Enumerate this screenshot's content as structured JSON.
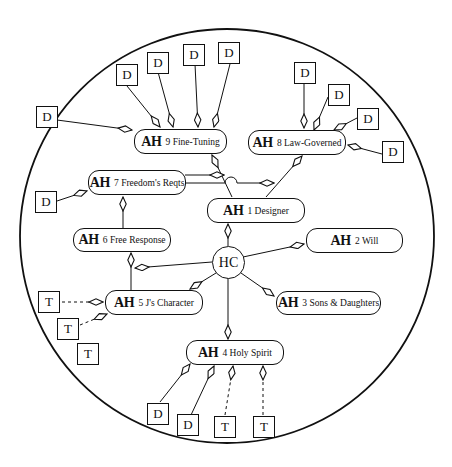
{
  "diagram": {
    "center": {
      "label": "HC"
    },
    "node_prefix": "AH",
    "nodes": [
      {
        "id": "n1",
        "num_label": "1 Designer"
      },
      {
        "id": "n2",
        "num_label": "2 Will"
      },
      {
        "id": "n3",
        "num_label": "3 Sons & Daughters"
      },
      {
        "id": "n4",
        "num_label": "4 Holy Spirit"
      },
      {
        "id": "n5",
        "num_label": "5 J's Character"
      },
      {
        "id": "n6",
        "num_label": "6 Free Response"
      },
      {
        "id": "n7",
        "num_label": "7 Freedom's Reqts"
      },
      {
        "id": "n8",
        "num_label": "8 Law-Governed"
      },
      {
        "id": "n9",
        "num_label": "9 Fine-Tuning"
      }
    ],
    "evidence": {
      "d_label": "D",
      "t_label": "T",
      "fine_tuning_D": [
        "D",
        "D",
        "D",
        "D",
        "D"
      ],
      "law_governed_D": [
        "D",
        "D",
        "D",
        "D"
      ],
      "freedoms_reqts_D": [
        "D"
      ],
      "js_character_T": [
        "T",
        "T",
        "T"
      ],
      "holy_spirit": [
        "D",
        "D",
        "T",
        "T"
      ]
    },
    "legend_note": "solid arrows from D (data) boxes, dashed arrows from T (testimony) boxes"
  }
}
